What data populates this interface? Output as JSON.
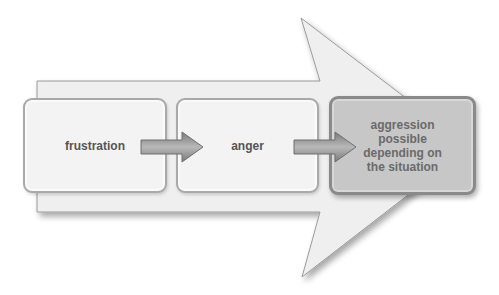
{
  "diagram": {
    "type": "process-flow",
    "steps": [
      {
        "label": "frustration"
      },
      {
        "label": "anger"
      },
      {
        "label": "aggression possible depending on the situation",
        "lines": [
          "aggression",
          "possible",
          "depending on",
          "the situation"
        ]
      }
    ],
    "colors": {
      "big_arrow_fill": "#efefef",
      "big_arrow_stroke": "#9a9a9a",
      "box_light_fill": "#f3f3f3",
      "box_dark_fill": "#c7c7c7",
      "connector_arrow": "#8c8c8c",
      "text": "#555555"
    }
  }
}
